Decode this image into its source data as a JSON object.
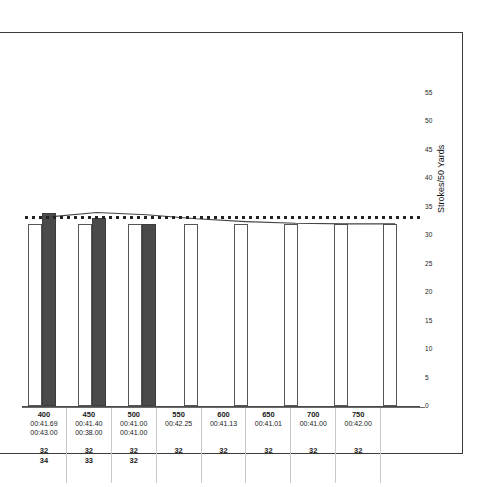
{
  "chart_data": {
    "type": "bar",
    "title": "",
    "xlabel": "",
    "ylabel": "Strokes/50 Yards",
    "ylim": [
      0,
      55
    ],
    "yticks": [
      0,
      5,
      10,
      15,
      20,
      25,
      30,
      35,
      40,
      45,
      50,
      55
    ],
    "grid": false,
    "legend": "none",
    "categories": [
      "400",
      "450",
      "500",
      "550",
      "600",
      "650",
      "700",
      "750"
    ],
    "series": [
      {
        "name": "Strokes set 1",
        "style": "white-bar",
        "values": [
          32,
          32,
          32,
          32,
          32,
          32,
          32,
          32
        ]
      },
      {
        "name": "Strokes set 2",
        "style": "dark-bar",
        "values": [
          34,
          33,
          32,
          null,
          null,
          null,
          null,
          null
        ]
      }
    ],
    "reference_line": {
      "name": "dotted-reference",
      "style": "dotted",
      "value": 32
    },
    "trend_line": {
      "name": "solid-trend",
      "style": "solid",
      "points": [
        33.2,
        34.0,
        33.6,
        32.9,
        32.4,
        32.1,
        32.0,
        32.0
      ]
    },
    "table": {
      "row_labels": [
        "distance",
        "time-1",
        "time-2",
        "strokes-1",
        "strokes-2"
      ],
      "columns": [
        {
          "category": "400",
          "time1": "00:41.69",
          "time2": "00:43.00",
          "strokes1": "32",
          "strokes2": "34"
        },
        {
          "category": "450",
          "time1": "00:41.40",
          "time2": "00:38.00",
          "strokes1": "32",
          "strokes2": "33"
        },
        {
          "category": "500",
          "time1": "00:41.00",
          "time2": "00:41.00",
          "strokes1": "32",
          "strokes2": "32"
        },
        {
          "category": "550",
          "time1": "00:42.25",
          "time2": "",
          "strokes1": "32",
          "strokes2": ""
        },
        {
          "category": "600",
          "time1": "00:41.13",
          "time2": "",
          "strokes1": "32",
          "strokes2": ""
        },
        {
          "category": "650",
          "time1": "00:41.01",
          "time2": "",
          "strokes1": "32",
          "strokes2": ""
        },
        {
          "category": "700",
          "time1": "00:41.00",
          "time2": "",
          "strokes1": "32",
          "strokes2": ""
        },
        {
          "category": "750",
          "time1": "00:42.00",
          "time2": "",
          "strokes1": "32",
          "strokes2": ""
        },
        {
          "category": "",
          "time1": "",
          "time2": "",
          "strokes1": "",
          "strokes2": ""
        }
      ]
    },
    "colors": {
      "bar_white_fill": "#ffffff",
      "bar_white_stroke": "#555555",
      "bar_dark_fill": "#4a4a4a",
      "axis": "#4a4a4a",
      "frame": "#3b3b3b",
      "text": "#1a1a1a"
    }
  }
}
